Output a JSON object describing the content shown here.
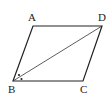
{
  "diagram": {
    "type": "parallelogram",
    "vertices": {
      "A": {
        "label": "A",
        "x": 33,
        "y": 26
      },
      "D": {
        "label": "D",
        "x": 102,
        "y": 26
      },
      "B": {
        "label": "B",
        "x": 13,
        "y": 81
      },
      "C": {
        "label": "C",
        "x": 83,
        "y": 81
      }
    },
    "diagonals": [
      {
        "from": "B",
        "to": "D"
      }
    ],
    "angle_marks": [
      {
        "vertex": "B",
        "marks": 2,
        "style": "dot"
      }
    ],
    "colors": {
      "stroke": "#222222",
      "background": "#ffffff"
    }
  }
}
